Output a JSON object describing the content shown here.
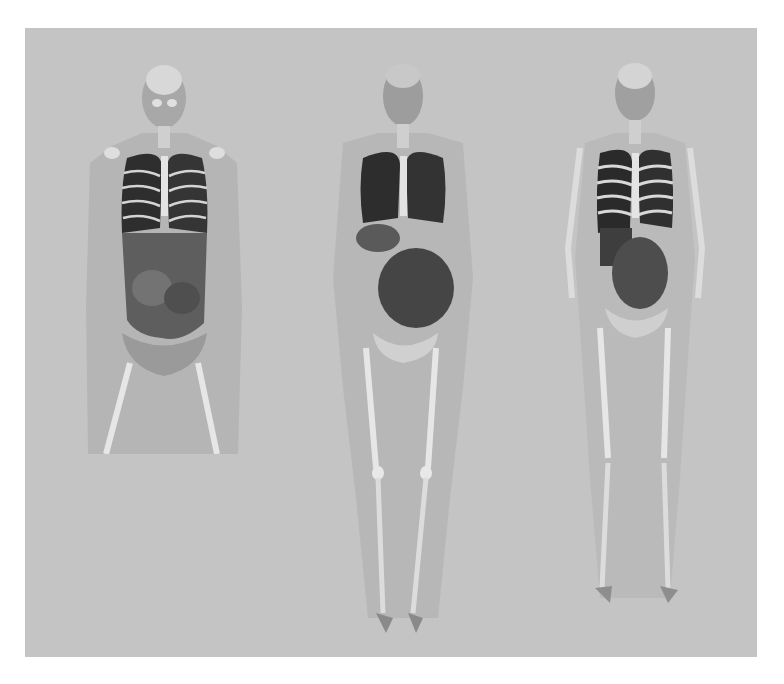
{
  "image": {
    "description": "Three 3D-rendered semi-transparent human body models in grayscale showing skeleton and internal organs, on a gray background",
    "background_color": "#c4c4c4",
    "figures": [
      {
        "id": "torso-model",
        "extent": "head to upper thighs",
        "position": "left"
      },
      {
        "id": "full-body-model-heavy",
        "extent": "full body, wide soft-tissue outline",
        "position": "center"
      },
      {
        "id": "full-body-model-slim",
        "extent": "full body, slim outline with visible ribcage",
        "position": "right"
      }
    ]
  }
}
